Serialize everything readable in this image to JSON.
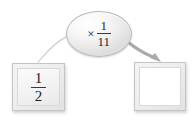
{
  "diagram": {
    "type": "function-machine",
    "background_color": "#ffffff",
    "operator_node": {
      "shape": "ellipse",
      "operation_symbol": "×",
      "operand": {
        "kind": "fraction",
        "numerator": "1",
        "denominator": "11"
      },
      "fill_color": "#f0f0f0",
      "border_color": "#b9b9b9"
    },
    "input_box": {
      "value": {
        "kind": "fraction",
        "numerator": "1",
        "denominator": "2"
      },
      "fill_color": "#f2f2f2",
      "border_color": "#c4c4c4"
    },
    "output_box": {
      "value": "",
      "placeholder": "",
      "fill_color": "#ffffff",
      "border_color": "#c4c4c4"
    },
    "connectors": [
      {
        "name": "input-to-operator",
        "style": "thin-curve",
        "has_arrowhead": false,
        "color": "#d2d2d2"
      },
      {
        "name": "operator-to-output",
        "style": "thick-curve",
        "has_arrowhead": true,
        "color": "#a8a8a8"
      }
    ]
  }
}
